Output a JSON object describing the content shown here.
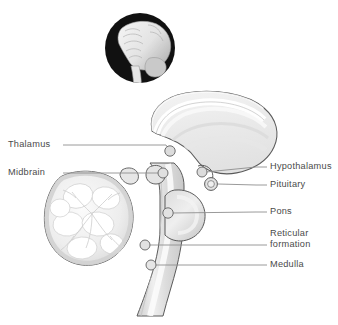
{
  "figure": {
    "kind": "anatomical-diagram",
    "background_color": "#ffffff",
    "line_color": "#555555",
    "leader_color": "#8c8c8c",
    "label_color": "#4a4a4a",
    "inset": {
      "name": "brain-lateral-inset",
      "disc_color": "#111111",
      "brain_fill_light": "#f2f2f2",
      "brain_fill_mid": "#bdbdbd"
    },
    "palette": {
      "cerebrum_fill": "#ececec",
      "cerebrum_band": "#f7f7f7",
      "cerebellum_cortex": "#d6d6d6",
      "cerebellum_arbor": "#ffffff",
      "brainstem_fill": "#d2d2d2",
      "brainstem_core": "#efefef",
      "pons_fill": "#cfcfcf",
      "marker_fill": "#e0e0e0",
      "marker_stroke": "#6f6f6f"
    }
  },
  "labels_left": [
    {
      "id": "thalamus",
      "text": "Thalamus",
      "x": 8,
      "y": 139,
      "line_x1": 63,
      "line_x2": 168,
      "line_y": 145,
      "marker_x": 170,
      "marker_y": 151
    },
    {
      "id": "midbrain",
      "text": "Midbrain",
      "x": 8,
      "y": 167,
      "line_x1": 63,
      "line_x2": 160,
      "line_y": 173,
      "marker_x": 163,
      "marker_y": 173
    }
  ],
  "labels_right": [
    {
      "id": "hypothalamus",
      "text": "Hypothalamus",
      "x": 270,
      "y": 161,
      "dash_x1": 256,
      "dash_x2": 267,
      "dash_y": 167,
      "leader_x1": 205,
      "leader_x2": 256,
      "leader_y": 167,
      "marker_x": 202,
      "marker_y": 172
    },
    {
      "id": "pituitary",
      "text": "Pituitary",
      "x": 270,
      "y": 179,
      "dash_x1": 256,
      "dash_x2": 267,
      "dash_y": 185,
      "leader_x1": 216,
      "leader_x2": 256,
      "leader_y": 185,
      "marker_x": 211,
      "marker_y": 183
    },
    {
      "id": "pons",
      "text": "Pons",
      "x": 270,
      "y": 206,
      "dash_x1": 256,
      "dash_x2": 267,
      "dash_y": 212,
      "leader_x1": 172,
      "leader_x2": 256,
      "leader_y": 212,
      "marker_x": 168,
      "marker_y": 213
    },
    {
      "id": "reticular-formation",
      "text": "Reticular\nformation",
      "line1": "Reticular",
      "line2": "formation",
      "x": 270,
      "y": 228,
      "dash_x1": 256,
      "dash_x2": 267,
      "dash_y": 245,
      "leader_x1": 150,
      "leader_x2": 256,
      "leader_y": 245,
      "marker_x": 145,
      "marker_y": 245
    },
    {
      "id": "medulla",
      "text": "Medulla",
      "x": 270,
      "y": 259,
      "dash_x1": 256,
      "dash_x2": 267,
      "dash_y": 265,
      "leader_x1": 156,
      "leader_x2": 256,
      "leader_y": 265,
      "marker_x": 151,
      "marker_y": 265
    }
  ],
  "structures": [
    {
      "id": "cerebrum",
      "name": "Cerebrum"
    },
    {
      "id": "corpus-callosum",
      "name": "Corpus callosum"
    },
    {
      "id": "cerebellum",
      "name": "Cerebellum"
    },
    {
      "id": "brainstem",
      "name": "Brainstem"
    },
    {
      "id": "thalamus",
      "name": "Thalamus"
    },
    {
      "id": "midbrain",
      "name": "Midbrain"
    },
    {
      "id": "hypothalamus",
      "name": "Hypothalamus"
    },
    {
      "id": "pituitary",
      "name": "Pituitary"
    },
    {
      "id": "pons",
      "name": "Pons"
    },
    {
      "id": "reticular-formation",
      "name": "Reticular formation"
    },
    {
      "id": "medulla",
      "name": "Medulla"
    }
  ]
}
